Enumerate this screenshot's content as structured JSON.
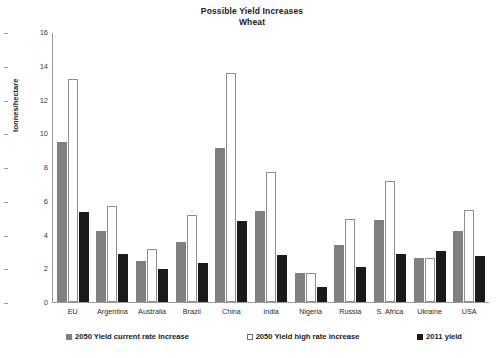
{
  "chart_data": {
    "type": "bar",
    "title": "Possible Yield Increases",
    "subtitle": "Wheat",
    "xlabel": "",
    "ylabel": "tonnes/hectare",
    "ylim": [
      0,
      16
    ],
    "yticks": [
      0,
      2,
      4,
      6,
      8,
      10,
      12,
      14,
      16
    ],
    "grid": false,
    "legend_position": "bottom",
    "categories": [
      "EU",
      "Argentina",
      "Australia",
      "Brazil",
      "China",
      "India",
      "Nigeria",
      "Russia",
      "S. Africa",
      "Ukraine",
      "USA"
    ],
    "series": [
      {
        "name": "2050 Yield current rate increase",
        "color": "#808080",
        "values": [
          9.5,
          4.2,
          2.45,
          3.55,
          9.15,
          5.4,
          1.7,
          3.35,
          4.85,
          2.6,
          4.2
        ]
      },
      {
        "name": "2050 Yield high rate increase",
        "color": "#ffffff",
        "values": [
          13.2,
          5.7,
          3.15,
          5.15,
          13.55,
          7.7,
          1.7,
          4.9,
          7.2,
          2.6,
          5.45
        ]
      },
      {
        "name": "2011 yield",
        "color": "#1a1a1a",
        "values": [
          5.35,
          2.85,
          1.95,
          2.3,
          4.8,
          2.8,
          0.9,
          2.05,
          2.85,
          3.05,
          2.7
        ]
      }
    ]
  }
}
